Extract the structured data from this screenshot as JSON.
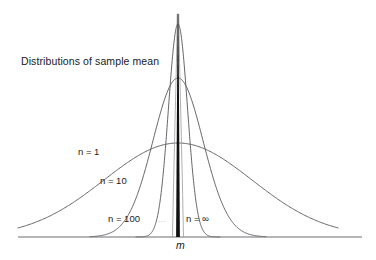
{
  "figure": {
    "title": "Distributions of sample mean",
    "axis_label": "m",
    "ellipsis": "...",
    "background_color": "#ffffff",
    "curve_color": "#55555a",
    "axis_color": "#6e6e72",
    "spike_color": "#111111"
  },
  "labels": {
    "n1": "n = 1",
    "n10": "n = 10",
    "n100": "n = 100",
    "ninf": "n = ∞"
  },
  "chart_data": {
    "type": "line",
    "title": "Distributions of sample mean",
    "xlabel": "m",
    "ylabel": "",
    "grid": false,
    "legend_position": "inline-annotations",
    "annotations": [
      {
        "text": "Distributions of sample mean",
        "x_px": 21,
        "y_px": 56
      },
      {
        "text": "n = 1",
        "x_px": 78,
        "y_px": 147
      },
      {
        "text": "n = 10",
        "x_px": 100,
        "y_px": 176
      },
      {
        "text": "n = 100",
        "x_px": 108,
        "y_px": 214
      },
      {
        "text": "...",
        "x_px": 158,
        "y_px": 216
      },
      {
        "text": "n = ∞",
        "x_px": 186,
        "y_px": 214
      },
      {
        "text": "m",
        "x_px": 176,
        "y_px": 240
      }
    ],
    "x_center_px": 178,
    "baseline_y_px": 237,
    "xlim": [
      0,
      376
    ],
    "ylim": [
      0,
      237
    ],
    "series": [
      {
        "name": "n = 1",
        "sample_size": 1,
        "sigma_px": 74,
        "peak_y_px": 143,
        "peak_height_px": 94,
        "half_width_px": 160,
        "color": "#55555a"
      },
      {
        "name": "n = 10",
        "sample_size": 10,
        "sigma_px": 25,
        "peak_y_px": 78,
        "peak_height_px": 159,
        "half_width_px": 88,
        "color": "#55555a"
      },
      {
        "name": "n = 100",
        "sample_size": 100,
        "sigma_px": 9.5,
        "peak_y_px": 24,
        "peak_height_px": 213,
        "half_width_px": 42,
        "color": "#55555a"
      },
      {
        "name": "n = ∞",
        "sample_size": "∞",
        "sigma_px": 0.8,
        "peak_y_px": 14,
        "peak_height_px": 223,
        "half_width_px": 3,
        "color": "#111111"
      }
    ]
  }
}
